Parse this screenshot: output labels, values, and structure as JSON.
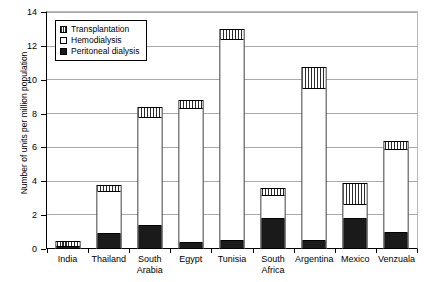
{
  "chart_data": {
    "type": "bar",
    "subtype": "stacked-vertical",
    "title": "",
    "xlabel": "",
    "ylabel": "Number of units per million population",
    "ylim": [
      0,
      14
    ],
    "yticks": [
      0,
      2,
      4,
      6,
      8,
      10,
      12,
      14
    ],
    "ytick_labels": [
      "0",
      "2",
      "4",
      "6",
      "8",
      "10",
      "12",
      "14"
    ],
    "grid": "horizontal",
    "legend_position": "top-left-inside",
    "categories": [
      "India",
      "Thailand",
      "South\nArabia",
      "Egypt",
      "Tunisia",
      "South\nAfrica",
      "Argentina",
      "Mexico",
      "Venzuala"
    ],
    "series": [
      {
        "name": "Peritoneal dialysis",
        "fill": "solid-black",
        "color": "#1a1a1a",
        "values": [
          0.05,
          0.8,
          1.3,
          0.3,
          0.4,
          1.7,
          0.4,
          1.7,
          0.9
        ]
      },
      {
        "name": "Hemodialysis",
        "fill": "white",
        "color": "#ffffff",
        "values": [
          0.15,
          2.6,
          6.5,
          8.0,
          12.0,
          1.5,
          9.1,
          0.95,
          5.0
        ]
      },
      {
        "name": "Transplantation",
        "fill": "vertical-hatch",
        "color": "#2b2b2b",
        "values": [
          0.3,
          0.4,
          0.6,
          0.5,
          0.6,
          0.4,
          1.25,
          1.25,
          0.5
        ]
      }
    ],
    "totals": [
      0.5,
      3.8,
      8.4,
      8.8,
      13.0,
      3.6,
      10.75,
      3.9,
      6.4
    ]
  },
  "legend": {
    "entries": [
      {
        "label": "Transplantation",
        "swatch": "hatched-square-icon"
      },
      {
        "label": "Hemodialysis",
        "swatch": "empty-square-icon"
      },
      {
        "label": "Peritoneal dialysis",
        "swatch": "filled-square-icon"
      }
    ]
  },
  "axis": {
    "y_title": "Number of units per million population"
  }
}
